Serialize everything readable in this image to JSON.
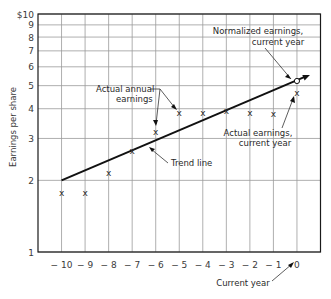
{
  "chart_data": {
    "type": "line",
    "title": "",
    "xlabel": "Current year",
    "ylabel": "Earnings per share",
    "yscale": "log",
    "ylim": [
      1,
      10
    ],
    "xlim": [
      -11,
      1
    ],
    "grid": true,
    "x_ticks": [
      -10,
      -9,
      -8,
      -7,
      -6,
      -5,
      -4,
      -3,
      -2,
      -1,
      0
    ],
    "x_tick_labels": [
      "-10",
      "-9",
      "-8",
      "-7",
      "-6",
      "-5",
      "-4",
      "-3",
      "-2",
      "-1",
      "0"
    ],
    "y_ticks": [
      1,
      2,
      3,
      4,
      5,
      6,
      7,
      8,
      9,
      10
    ],
    "y_tick_labels": [
      "1",
      "2",
      "3",
      "4",
      "5",
      "6",
      "7",
      "8",
      "9",
      "$10"
    ],
    "series": [
      {
        "name": "Actual annual earnings",
        "marker": "x",
        "x": [
          -10,
          -9,
          -8,
          -7,
          -6,
          -5,
          -4,
          -3,
          -2,
          -1,
          0
        ],
        "values": [
          1.77,
          1.77,
          2.15,
          2.68,
          3.22,
          3.87,
          3.87,
          3.95,
          3.87,
          3.83,
          4.7
        ]
      },
      {
        "name": "Trend line",
        "style": "line-with-arrow",
        "x": [
          -10,
          0.55
        ],
        "values": [
          2.0,
          5.54
        ]
      },
      {
        "name": "Normalized earnings, current year",
        "marker": "circle",
        "x": [
          0
        ],
        "values": [
          5.23
        ]
      }
    ],
    "annotations": [
      {
        "lines": [
          "Normalized earnings,",
          "current year"
        ],
        "target": "normalized-point"
      },
      {
        "lines": [
          "Actual annual",
          "earnings"
        ],
        "target": "actual-points"
      },
      {
        "lines": [
          "Actual earnings,",
          "current year"
        ],
        "target": "current-actual-point"
      },
      {
        "lines": [
          "Trend line"
        ],
        "target": "trend-line"
      },
      {
        "lines": [
          "Current year"
        ],
        "target": "x-zero"
      }
    ]
  }
}
